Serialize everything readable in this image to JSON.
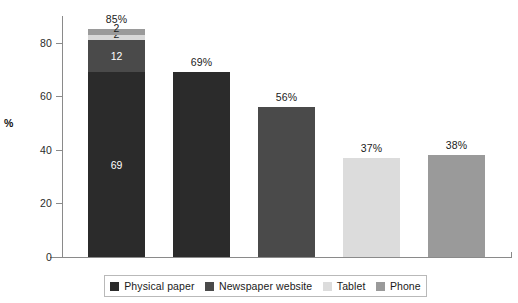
{
  "chart_data": {
    "type": "bar",
    "title": "",
    "subtitle": "",
    "xlabel": "",
    "ylabel": "%",
    "ylim": [
      0,
      90
    ],
    "yticks": [
      0,
      20,
      40,
      60,
      80
    ],
    "ytick_labels": [
      "0",
      "20",
      "40",
      "60",
      "80"
    ],
    "grid": false,
    "legend_position": "bottom",
    "stacked": true,
    "categories": [
      "Bar 1",
      "Bar 2",
      "Bar 3",
      "Bar 4",
      "Bar 5"
    ],
    "bar_totals": [
      85,
      69,
      56,
      37,
      38
    ],
    "bar_total_labels": [
      "85%",
      "69%",
      "56%",
      "37%",
      "38%"
    ],
    "series": [
      {
        "name": "Physical paper",
        "color": "#2b2b2b",
        "values": [
          69,
          69,
          0,
          0,
          0
        ]
      },
      {
        "name": "Newspaper website",
        "color": "#4a4a4a",
        "values": [
          12,
          0,
          56,
          0,
          0
        ]
      },
      {
        "name": "Tablet",
        "color": "#dcdcdc",
        "values": [
          2,
          0,
          0,
          37,
          0
        ]
      },
      {
        "name": "Phone",
        "color": "#9a9a9a",
        "values": [
          2,
          0,
          0,
          0,
          38
        ]
      }
    ],
    "segment_labels": {
      "bar1": [
        "69",
        "12",
        "2",
        "2"
      ]
    },
    "bars": [
      {
        "total_label": "85%",
        "segments": [
          {
            "series": "Physical paper",
            "value": 69,
            "label": "69",
            "color": "#2b2b2b",
            "label_color": "#ffffff"
          },
          {
            "series": "Newspaper website",
            "value": 12,
            "label": "12",
            "color": "#4a4a4a",
            "label_color": "#ffffff"
          },
          {
            "series": "Tablet",
            "value": 2,
            "label": "2",
            "color": "#d8d8d8",
            "label_color": "#1a1a1a"
          },
          {
            "series": "Phone",
            "value": 2,
            "label": "2",
            "color": "#9a9a9a",
            "label_color": "#1a1a1a"
          }
        ]
      },
      {
        "total_label": "69%",
        "segments": [
          {
            "series": "Physical paper",
            "value": 69,
            "label": "",
            "color": "#2b2b2b",
            "label_color": "#ffffff"
          }
        ]
      },
      {
        "total_label": "56%",
        "segments": [
          {
            "series": "Newspaper website",
            "value": 56,
            "label": "",
            "color": "#4a4a4a",
            "label_color": "#ffffff"
          }
        ]
      },
      {
        "total_label": "37%",
        "segments": [
          {
            "series": "Tablet",
            "value": 37,
            "label": "",
            "color": "#dcdcdc",
            "label_color": "#1a1a1a"
          }
        ]
      },
      {
        "total_label": "38%",
        "segments": [
          {
            "series": "Phone",
            "value": 38,
            "label": "",
            "color": "#9a9a9a",
            "label_color": "#1a1a1a"
          }
        ]
      }
    ],
    "legend": [
      {
        "label": "Physical paper",
        "color": "#2b2b2b"
      },
      {
        "label": "Newspaper website",
        "color": "#4a4a4a"
      },
      {
        "label": "Tablet",
        "color": "#dcdcdc"
      },
      {
        "label": "Phone",
        "color": "#9a9a9a"
      }
    ]
  }
}
